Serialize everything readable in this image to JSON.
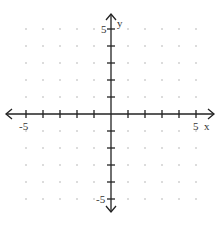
{
  "chart_data": {
    "type": "scatter",
    "title": "",
    "xlabel": "x",
    "ylabel": "y",
    "xlim": [
      -5,
      5
    ],
    "ylim": [
      -5,
      5
    ],
    "grid": "dots",
    "tick_step": 1,
    "x_tick_labels": [
      {
        "value": -5,
        "label": "-5"
      },
      {
        "value": 5,
        "label": "5"
      }
    ],
    "y_tick_labels": [
      {
        "value": 5,
        "label": "5"
      },
      {
        "value": -5,
        "label": "-5"
      }
    ],
    "series": []
  },
  "labels": {
    "x_axis": "x",
    "y_axis": "y",
    "x_min": "-5",
    "x_max": "5",
    "y_max": "5",
    "y_min": "-5"
  },
  "colors": {
    "axis": "#222222",
    "grid_dot": "#b0b0b0",
    "text": "#333333"
  }
}
